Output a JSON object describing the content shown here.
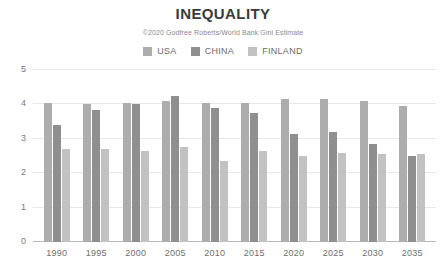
{
  "chart_data": {
    "type": "bar",
    "title": "INEQUALITY",
    "subtitle": "©2020 Godfree Roberts/World Bank Gini Estimate",
    "xlabel": "",
    "ylabel": "",
    "ylim": [
      0,
      5
    ],
    "yticks": [
      0,
      1,
      2,
      3,
      4,
      5
    ],
    "grid": true,
    "legend_position": "top",
    "categories": [
      "1990",
      "1995",
      "2000",
      "2005",
      "2010",
      "2015",
      "2020",
      "2025",
      "2030",
      "2035"
    ],
    "series": [
      {
        "name": "USA",
        "color": "#adadad",
        "values": [
          4.05,
          4.0,
          4.05,
          4.1,
          4.05,
          4.05,
          4.15,
          4.15,
          4.1,
          3.95
        ]
      },
      {
        "name": "CHINA",
        "color": "#8f8f8f",
        "values": [
          3.4,
          3.85,
          4.0,
          4.25,
          3.9,
          3.75,
          3.15,
          3.2,
          2.85,
          2.5
        ]
      },
      {
        "name": "FINLAND",
        "color": "#c2c2c2",
        "values": [
          2.7,
          2.7,
          2.65,
          2.75,
          2.35,
          2.65,
          2.5,
          2.6,
          2.55,
          2.55
        ]
      }
    ]
  },
  "colors": {
    "background": "#ffffff",
    "title": "#3b3b3b",
    "subtitle": "#8a8a8a",
    "tick": "#7a7a7a",
    "gridline": "#e8e8e8",
    "axis": "#b9b9b9"
  }
}
